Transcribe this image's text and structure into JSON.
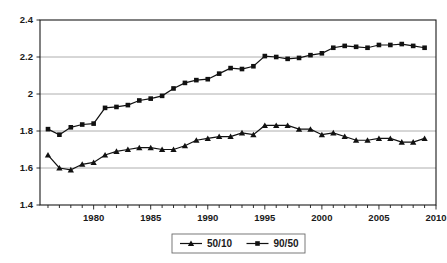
{
  "chart_data": {
    "type": "line",
    "title": "",
    "subtitle": "",
    "xlabel": "",
    "ylabel": "",
    "xlim": [
      1975.3,
      2010
    ],
    "ylim": [
      1.4,
      2.4
    ],
    "grid": true,
    "grid_axis": "y",
    "legend_position": "bottom-center",
    "x": [
      1976,
      1977,
      1978,
      1979,
      1980,
      1981,
      1982,
      1983,
      1984,
      1985,
      1986,
      1987,
      1988,
      1989,
      1990,
      1991,
      1992,
      1993,
      1994,
      1995,
      1996,
      1997,
      1998,
      1999,
      2000,
      2001,
      2002,
      2003,
      2004,
      2005,
      2006,
      2007,
      2008,
      2009
    ],
    "x_tick_labels": [
      "1980",
      "1985",
      "1990",
      "1995",
      "2000",
      "2005",
      "2010"
    ],
    "x_ticks": [
      1980,
      1985,
      1990,
      1995,
      2000,
      2005,
      2010
    ],
    "y_tick_labels": [
      "1.4",
      "1.6",
      "1.8",
      "2",
      "2.2",
      "2.4"
    ],
    "y_ticks": [
      1.4,
      1.6,
      1.8,
      2.0,
      2.2,
      2.4
    ],
    "series": [
      {
        "name": "50/10",
        "marker": "triangle",
        "color": "#111111",
        "values": [
          1.67,
          1.6,
          1.59,
          1.62,
          1.63,
          1.67,
          1.69,
          1.7,
          1.71,
          1.71,
          1.7,
          1.7,
          1.72,
          1.75,
          1.76,
          1.77,
          1.77,
          1.79,
          1.78,
          1.83,
          1.83,
          1.83,
          1.81,
          1.81,
          1.78,
          1.79,
          1.77,
          1.75,
          1.75,
          1.76,
          1.76,
          1.74,
          1.74,
          1.76
        ]
      },
      {
        "name": "90/50",
        "marker": "square",
        "color": "#111111",
        "values": [
          1.81,
          1.78,
          1.82,
          1.835,
          1.84,
          1.925,
          1.93,
          1.94,
          1.965,
          1.975,
          1.99,
          2.03,
          2.06,
          2.075,
          2.08,
          2.11,
          2.14,
          2.135,
          2.15,
          2.205,
          2.2,
          2.19,
          2.195,
          2.21,
          2.22,
          2.25,
          2.26,
          2.255,
          2.25,
          2.265,
          2.265,
          2.27,
          2.26,
          2.25
        ]
      }
    ]
  },
  "legend": {
    "entries": [
      {
        "label": "50/10",
        "marker": "triangle"
      },
      {
        "label": "90/50",
        "marker": "square"
      }
    ]
  },
  "colors": {
    "line": "#111111",
    "grid": "#9a9a9a",
    "axis": "#1a1a1a",
    "background": "#ffffff"
  }
}
